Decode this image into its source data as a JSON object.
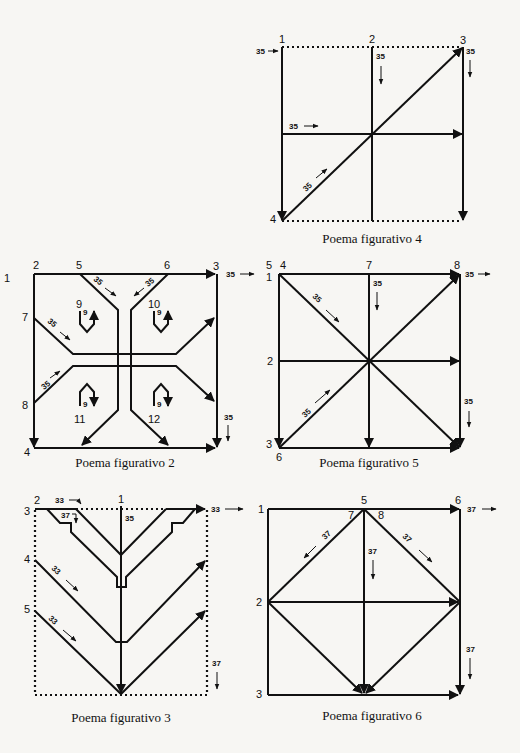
{
  "figures": [
    {
      "id": "fig4",
      "caption": "Poema figurativo 4",
      "labels": {
        "n1": "1",
        "n2": "2",
        "n3": "3",
        "n4": "4"
      },
      "values": {
        "a": "35",
        "b": "35",
        "c": "35",
        "d": "35",
        "e": "35"
      }
    },
    {
      "id": "fig2",
      "caption": "Poema figurativo 2",
      "labels": {
        "n1": "1",
        "n2": "2",
        "n3": "3",
        "n4": "4",
        "n5": "5",
        "n6": "6",
        "n7": "7",
        "n8": "8",
        "n9": "9",
        "n10": "10",
        "n11": "11",
        "n12": "12"
      },
      "values": {
        "a": "35",
        "b": "35",
        "c": "35",
        "d": "35",
        "e": "35",
        "f": "35",
        "g": "9",
        "h": "9",
        "i": "9",
        "j": "9"
      }
    },
    {
      "id": "fig5",
      "caption": "Poema figurativo 5",
      "labels": {
        "n1": "1",
        "n2": "2",
        "n3": "3",
        "n4": "4",
        "n5": "5",
        "n6": "6",
        "n7": "7",
        "n8": "8"
      },
      "values": {
        "a": "35",
        "b": "35",
        "c": "35",
        "d": "35",
        "e": "35"
      }
    },
    {
      "id": "fig3",
      "caption": "Poema figurativo 3",
      "labels": {
        "n1": "1",
        "n2": "2",
        "n3": "3",
        "n4": "4",
        "n5": "5"
      },
      "values": {
        "a": "33",
        "b": "37",
        "c": "35",
        "d": "33",
        "e": "33",
        "f": "33",
        "g": "37"
      }
    },
    {
      "id": "fig6",
      "caption": "Poema figurativo 6",
      "labels": {
        "n1": "1",
        "n2": "2",
        "n3": "3",
        "n5": "5",
        "n6": "6",
        "n7": "7",
        "n8": "8"
      },
      "values": {
        "a": "37",
        "b": "37",
        "c": "37",
        "d": "37",
        "e": "37"
      }
    }
  ]
}
